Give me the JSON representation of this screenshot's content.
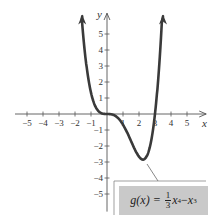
{
  "chart_data": {
    "type": "line",
    "title": "",
    "xlabel": "x",
    "ylabel": "y",
    "xlim": [
      -5.5,
      6.2
    ],
    "ylim": [
      -6.1,
      6.3
    ],
    "grid": false,
    "x_ticks": [
      -5,
      -4,
      -3,
      -2,
      -1,
      1,
      2,
      3,
      4,
      5
    ],
    "y_ticks": [
      5,
      4,
      3,
      2,
      1,
      -1,
      -2,
      -3,
      -4,
      -5
    ],
    "series": [
      {
        "name": "g(x) = (1/3)x^4 - x^3",
        "function": "x^4/3 - x^3",
        "domain": [
          -1.6,
          3.45
        ],
        "points": [
          {
            "x": -1.5,
            "y": 5.06
          },
          {
            "x": -1,
            "y": 1.33
          },
          {
            "x": 0,
            "y": 0
          },
          {
            "x": 1,
            "y": -0.67
          },
          {
            "x": 2,
            "y": -2.67
          },
          {
            "x": 2.25,
            "y": -2.85
          },
          {
            "x": 3,
            "y": 0
          },
          {
            "x": 3.4,
            "y": 4.2
          }
        ],
        "color": "#3a3a3a",
        "arrows_at_ends": true
      }
    ],
    "annotations": [
      {
        "text": "g(x) = 1/3 x^4 − x^3",
        "points_to": {
          "x": 2.25,
          "y": -2.85
        },
        "box_color": "#c9c9c9"
      }
    ]
  },
  "labels": {
    "x_axis": "x",
    "y_axis": "y",
    "formula_lhs": "g(x) =",
    "formula_num": "1",
    "formula_den": "3",
    "formula_x1": "x",
    "formula_exp1": "4",
    "formula_minus": " − ",
    "formula_x2": "x",
    "formula_exp2": "3"
  },
  "colors": {
    "curve": "#3a3a3a",
    "axes": "#555555",
    "box": "#c9c9c9"
  }
}
